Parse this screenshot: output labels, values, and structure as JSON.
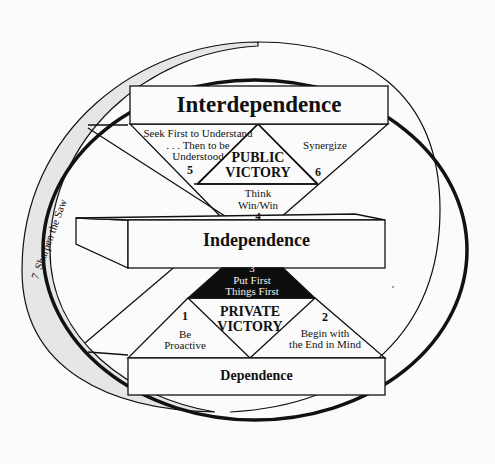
{
  "diagram": {
    "outer_ring": {
      "number": "7",
      "label": "Sharpen the Saw"
    },
    "blocks": {
      "interdependence": "Interdependence",
      "independence": "Independence",
      "dependence": "Dependence"
    },
    "victories": {
      "public": {
        "line1": "PUBLIC",
        "line2": "VICTORY"
      },
      "private": {
        "line1": "PRIVATE",
        "line2": "VICTORY"
      }
    },
    "habits": [
      {
        "number": "1",
        "line1": "Be",
        "line2": "Proactive"
      },
      {
        "number": "2",
        "line1": "Begin with",
        "line2": "the End in Mind"
      },
      {
        "number": "3",
        "line1": "Put First",
        "line2": "Things First"
      },
      {
        "number": "4",
        "line1": "Think",
        "line2": "Win/Win"
      },
      {
        "number": "5",
        "line1": "Seek First to Understand",
        "line2": ". . . Then to be",
        "line3": "Understood"
      },
      {
        "number": "6",
        "line1": "Synergize"
      }
    ],
    "colors": {
      "ink": "#111111",
      "ring_fill": "#e6e6e6",
      "background": "#fbfbfb",
      "habit3_fill": "#0d0d0d"
    }
  }
}
